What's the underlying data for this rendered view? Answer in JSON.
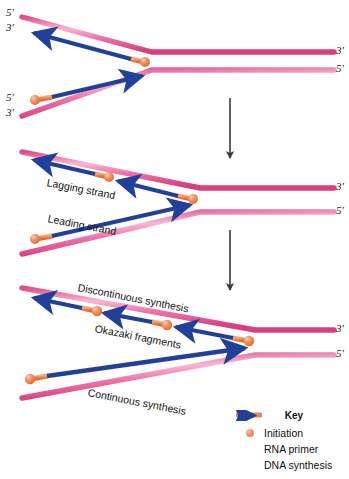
{
  "diagram": {
    "colors": {
      "template_strand": "#e8609a",
      "template_strand_highlight": "#f8a9c8",
      "dna_synthesis_arrow": "#21409a",
      "rna_primer": "#ef7f4b",
      "initiation_dot": "#f2936a",
      "transition_arrow": "#3a3a3a",
      "text": "#141414",
      "background": "#ffffff"
    },
    "panels": [
      {
        "id": "panel-1",
        "end_labels": [
          {
            "text": "5′",
            "position": "top-left-upper"
          },
          {
            "text": "3′",
            "position": "top-left-lower"
          },
          {
            "text": "5′",
            "position": "bottom-left-upper"
          },
          {
            "text": "3′",
            "position": "bottom-left-lower"
          },
          {
            "text": "3′",
            "position": "right-upper"
          },
          {
            "text": "5′",
            "position": "right-lower"
          }
        ],
        "strand_labels": []
      },
      {
        "id": "panel-2",
        "end_labels": [
          {
            "text": "3′",
            "position": "right-upper"
          },
          {
            "text": "5′",
            "position": "right-lower"
          }
        ],
        "strand_labels": [
          {
            "text": "Lagging strand"
          },
          {
            "text": "Leading strand"
          }
        ]
      },
      {
        "id": "panel-3",
        "end_labels": [
          {
            "text": "3′",
            "position": "right-upper"
          },
          {
            "text": "5′",
            "position": "right-lower"
          }
        ],
        "strand_labels": [
          {
            "text": "Discontinuous synthesis"
          },
          {
            "text": "Okazaki fragments"
          },
          {
            "text": "Continuous synthesis"
          }
        ]
      }
    ],
    "transition_arrows": [
      {
        "id": "arrow-1-2",
        "direction": "down"
      },
      {
        "id": "arrow-2-3",
        "direction": "down"
      }
    ]
  },
  "legend": {
    "title": "Key",
    "items": [
      {
        "icon": "initiation-dot-icon",
        "label": "Initiation"
      },
      {
        "icon": "rna-primer-bar-icon",
        "label": "RNA primer"
      },
      {
        "icon": "dna-synthesis-arrow-icon",
        "label": "DNA synthesis"
      }
    ]
  }
}
